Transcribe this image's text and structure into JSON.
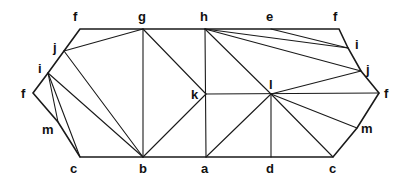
{
  "diagram": {
    "type": "net-triangulation",
    "stroke_color": "#1a1a1a",
    "vertices": {
      "f_tl": {
        "label": "f",
        "x": 80,
        "y": 29,
        "lx": 73,
        "ly": 21
      },
      "g": {
        "label": "g",
        "x": 143,
        "y": 29,
        "lx": 138,
        "ly": 21
      },
      "h": {
        "label": "h",
        "x": 205,
        "y": 29,
        "lx": 200,
        "ly": 21
      },
      "e": {
        "label": "e",
        "x": 271,
        "y": 29,
        "lx": 266,
        "ly": 21
      },
      "f_tr": {
        "label": "f",
        "x": 339,
        "y": 29,
        "lx": 333,
        "ly": 21
      },
      "j_l": {
        "label": "j",
        "x": 64,
        "y": 51,
        "lx": 53,
        "ly": 52
      },
      "i_l": {
        "label": "i",
        "x": 48,
        "y": 73,
        "lx": 38,
        "ly": 73
      },
      "f_l": {
        "label": "f",
        "x": 33,
        "y": 93,
        "lx": 21,
        "ly": 98
      },
      "m_l": {
        "label": "m",
        "x": 58,
        "y": 122,
        "lx": 42,
        "ly": 134
      },
      "c_l": {
        "label": "c",
        "x": 80,
        "y": 157,
        "lx": 70,
        "ly": 173
      },
      "b": {
        "label": "b",
        "x": 143,
        "y": 157,
        "lx": 139,
        "ly": 173
      },
      "a": {
        "label": "a",
        "x": 206,
        "y": 157,
        "lx": 201,
        "ly": 173
      },
      "d": {
        "label": "d",
        "x": 271,
        "y": 157,
        "lx": 266,
        "ly": 173
      },
      "c_r": {
        "label": "c",
        "x": 333,
        "y": 157,
        "lx": 329,
        "ly": 173
      },
      "k": {
        "label": "k",
        "x": 206,
        "y": 94,
        "lx": 191,
        "ly": 99
      },
      "l": {
        "label": "l",
        "x": 271,
        "y": 94,
        "lx": 269,
        "ly": 89
      },
      "i_r": {
        "label": "i",
        "x": 348,
        "y": 48,
        "lx": 355,
        "ly": 49
      },
      "j_r": {
        "label": "j",
        "x": 361,
        "y": 71,
        "lx": 366,
        "ly": 74
      },
      "f_r": {
        "label": "f",
        "x": 379,
        "y": 93,
        "lx": 384,
        "ly": 98
      },
      "m_r": {
        "label": "m",
        "x": 357,
        "y": 128,
        "lx": 361,
        "ly": 133
      }
    },
    "outline": [
      "f_tl",
      "f_tr",
      "i_r",
      "j_r",
      "f_r",
      "m_r",
      "c_r",
      "c_l",
      "m_l",
      "f_l",
      "i_l",
      "j_l",
      "f_tl"
    ],
    "edges": [
      [
        "j_l",
        "g"
      ],
      [
        "g",
        "b"
      ],
      [
        "g",
        "k"
      ],
      [
        "j_l",
        "b"
      ],
      [
        "i_l",
        "b"
      ],
      [
        "i_l",
        "c_l"
      ],
      [
        "i_l",
        "m_l"
      ],
      [
        "k",
        "b"
      ],
      [
        "h",
        "a"
      ],
      [
        "k",
        "f_r"
      ],
      [
        "h",
        "l"
      ],
      [
        "h",
        "i_r"
      ],
      [
        "e",
        "i_r"
      ],
      [
        "h",
        "j_r"
      ],
      [
        "l",
        "j_r"
      ],
      [
        "l",
        "a"
      ],
      [
        "l",
        "d"
      ],
      [
        "l",
        "c_r"
      ],
      [
        "l",
        "m_r"
      ]
    ]
  }
}
